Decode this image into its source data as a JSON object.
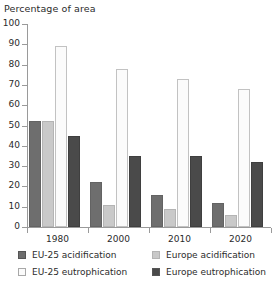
{
  "chart_data": {
    "type": "bar",
    "title": "Percentage of area",
    "xlabel": "",
    "ylabel": "Percentage of area",
    "ylim": [
      0,
      100
    ],
    "ytick_step": 10,
    "yticks": [
      0,
      10,
      20,
      30,
      40,
      50,
      60,
      70,
      80,
      90,
      100
    ],
    "grid": false,
    "legend_position": "bottom",
    "categories": [
      "1980",
      "2000",
      "2010",
      "2020"
    ],
    "series": [
      {
        "name": "EU-25 acidification",
        "color": "#6e6e6e",
        "values": [
          52,
          22,
          16,
          12
        ]
      },
      {
        "name": "Europe acidification",
        "color": "#c9c9c9",
        "values": [
          52,
          11,
          9,
          6
        ]
      },
      {
        "name": "EU-25 eutrophication",
        "color": "#fbfbfb",
        "values": [
          89,
          78,
          73,
          68
        ]
      },
      {
        "name": "Europe eutrophication",
        "color": "#4a4a4a",
        "values": [
          45,
          35,
          35,
          32
        ]
      }
    ]
  },
  "axis": {
    "title": "Percentage of area"
  },
  "colors": {
    "axis": "#9a9a9a",
    "text": "#2b2b2b",
    "background": "#ffffff"
  }
}
